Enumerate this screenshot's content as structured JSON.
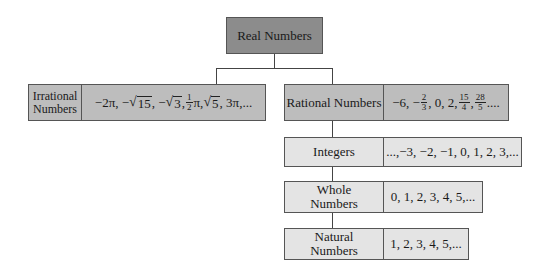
{
  "root": {
    "label": "Real Numbers"
  },
  "irrational": {
    "label_line1": "Irrational",
    "label_line2": "Numbers",
    "examples": {
      "t1": "−2π, −",
      "sqrt15": "15",
      "t2": ", −",
      "sqrt3": "3",
      "t3": " ,",
      "frac_num": "1",
      "frac_den": "2",
      "t4": "π, ",
      "sqrt5": "5",
      "t5": " , 3π,..."
    }
  },
  "rational": {
    "label": "Rational Numbers",
    "examples": {
      "t1": "−6, −",
      "f1_num": "2",
      "f1_den": "3",
      "t2": ", 0, 2,",
      "f2_num": "15",
      "f2_den": "4",
      "t3": ",",
      "f3_num": "28",
      "f3_den": "5",
      "t4": "...."
    }
  },
  "integers": {
    "label": "Integers",
    "examples": "...,−3, −2, −1, 0, 1, 2,  3,..."
  },
  "whole": {
    "label_line1": "Whole",
    "label_line2": "Numbers",
    "examples": "0, 1, 2, 3, 4, 5,..."
  },
  "natural": {
    "label_line1": "Natural",
    "label_line2": "Numbers",
    "examples": "1, 2, 3, 4, 5,..."
  },
  "colors": {
    "dark": "#8c8c8c",
    "mid": "#bdbdbd",
    "light": "#e4e4e4",
    "line": "#444444"
  }
}
